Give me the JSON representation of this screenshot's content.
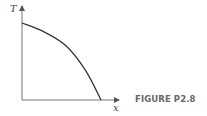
{
  "figure": {
    "caption": "FIGURE P2.8",
    "y_axis_label": "T",
    "x_axis_label": "x"
  },
  "chart_data": {
    "type": "line",
    "title": "",
    "xlabel": "x",
    "ylabel": "T",
    "grid": false,
    "legend": null,
    "x": [
      0,
      0.25,
      0.55,
      0.8,
      1.0
    ],
    "series": [
      {
        "name": "T(x)",
        "values": [
          1.0,
          0.9,
          0.71,
          0.39,
          0.0
        ]
      }
    ],
    "xlim": [
      0,
      1.2
    ],
    "ylim": [
      0,
      1.2
    ]
  }
}
